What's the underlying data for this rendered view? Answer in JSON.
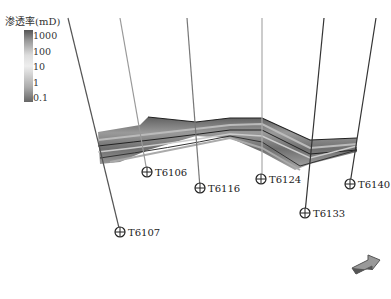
{
  "legend": {
    "title": "渗透率(mD)",
    "ticks": [
      {
        "label": "1000",
        "y": 33
      },
      {
        "label": "100",
        "y": 49
      },
      {
        "label": "10",
        "y": 64
      },
      {
        "label": "1",
        "y": 80
      },
      {
        "label": "0.1",
        "y": 95
      }
    ],
    "colors": [
      "#555555",
      "#dddddd",
      "#666666"
    ]
  },
  "wells": [
    {
      "name": "T6107",
      "line": [
        68,
        18,
        120,
        232
      ],
      "color": "#555",
      "marker": [
        120,
        232
      ],
      "label_xy": [
        128,
        227
      ]
    },
    {
      "name": "T6106",
      "line": [
        120,
        18,
        147,
        172
      ],
      "color": "#999",
      "marker": [
        147,
        172
      ],
      "label_xy": [
        155,
        167
      ]
    },
    {
      "name": "T6116",
      "line": [
        187,
        18,
        200,
        188
      ],
      "color": "#777",
      "marker": [
        200,
        188
      ],
      "label_xy": [
        208,
        183
      ]
    },
    {
      "name": "T6124",
      "line": [
        262,
        18,
        262,
        179
      ],
      "color": "#aaa",
      "marker": [
        261,
        179
      ],
      "label_xy": [
        269,
        174
      ]
    },
    {
      "name": "T6133",
      "line": [
        324,
        18,
        305,
        213
      ],
      "color": "#333",
      "marker": [
        305,
        213
      ],
      "label_xy": [
        313,
        208
      ]
    },
    {
      "name": "T6140",
      "line": [
        376,
        18,
        350,
        184
      ],
      "color": "#333",
      "marker": [
        350,
        184
      ],
      "label_xy": [
        358,
        179
      ]
    }
  ],
  "compass_icon": "3d-orientation-arrow-icon"
}
